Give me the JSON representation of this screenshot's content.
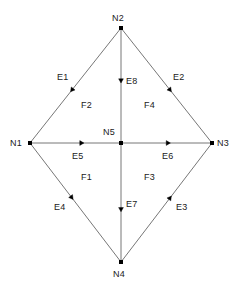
{
  "diagram": {
    "colors": {
      "background": "#ffffff",
      "edge_line": "#777777",
      "node_fill": "#000000",
      "arrow_fill": "#000000",
      "label_text": "#1a1a1a"
    },
    "nodes": [
      {
        "id": "n1",
        "label": "N1",
        "x": 30,
        "y": 143
      },
      {
        "id": "n2",
        "label": "N2",
        "x": 121,
        "y": 28
      },
      {
        "id": "n3",
        "label": "N3",
        "x": 212,
        "y": 143
      },
      {
        "id": "n4",
        "label": "N4",
        "x": 121,
        "y": 262
      },
      {
        "id": "n5",
        "label": "N5",
        "x": 121,
        "y": 143
      }
    ],
    "node_labels": [
      {
        "for": "n1",
        "label": "N1",
        "x": 10,
        "y": 138
      },
      {
        "for": "n2",
        "label": "N2",
        "x": 112,
        "y": 13
      },
      {
        "for": "n3",
        "label": "N3",
        "x": 217,
        "y": 138
      },
      {
        "for": "n4",
        "label": "N4",
        "x": 113,
        "y": 269
      },
      {
        "for": "n5",
        "label": "N5",
        "x": 103,
        "y": 127
      }
    ],
    "edges": [
      {
        "id": "e1",
        "label": "E1",
        "from": "n2",
        "to": "n1",
        "x1": 121,
        "y1": 28,
        "x2": 30,
        "y2": 143,
        "arrow_t": 0.54,
        "label_x": 57,
        "label_y": 72
      },
      {
        "id": "e2",
        "label": "E2",
        "from": "n2",
        "to": "n3",
        "x1": 121,
        "y1": 28,
        "x2": 212,
        "y2": 143,
        "arrow_t": 0.54,
        "label_x": 173,
        "label_y": 72
      },
      {
        "id": "e3",
        "label": "E3",
        "from": "n4",
        "to": "n3",
        "x1": 121,
        "y1": 262,
        "x2": 212,
        "y2": 143,
        "arrow_t": 0.54,
        "label_x": 176,
        "label_y": 202
      },
      {
        "id": "e4",
        "label": "E4",
        "from": "n1",
        "to": "n4",
        "x1": 30,
        "y1": 143,
        "x2": 121,
        "y2": 262,
        "arrow_t": 0.46,
        "label_x": 54,
        "label_y": 202
      },
      {
        "id": "e5",
        "label": "E5",
        "from": "n1",
        "to": "n5",
        "x1": 30,
        "y1": 143,
        "x2": 121,
        "y2": 143,
        "arrow_t": 0.57,
        "label_x": 72,
        "label_y": 151
      },
      {
        "id": "e6",
        "label": "E6",
        "from": "n5",
        "to": "n3",
        "x1": 121,
        "y1": 143,
        "x2": 212,
        "y2": 143,
        "arrow_t": 0.52,
        "label_x": 162,
        "label_y": 151
      },
      {
        "id": "e7",
        "label": "E7",
        "from": "n5",
        "to": "n4",
        "x1": 121,
        "y1": 143,
        "x2": 121,
        "y2": 262,
        "arrow_t": 0.56,
        "label_x": 126,
        "label_y": 199
      },
      {
        "id": "e8",
        "label": "E8",
        "from": "n2",
        "to": "n5",
        "x1": 121,
        "y1": 28,
        "x2": 121,
        "y2": 143,
        "arrow_t": 0.46,
        "label_x": 126,
        "label_y": 76
      }
    ],
    "faces": [
      {
        "id": "f1",
        "label": "F1",
        "x": 81,
        "y": 172
      },
      {
        "id": "f2",
        "label": "F2",
        "x": 81,
        "y": 100
      },
      {
        "id": "f3",
        "label": "F3",
        "x": 144,
        "y": 172
      },
      {
        "id": "f4",
        "label": "F4",
        "x": 144,
        "y": 100
      }
    ]
  }
}
